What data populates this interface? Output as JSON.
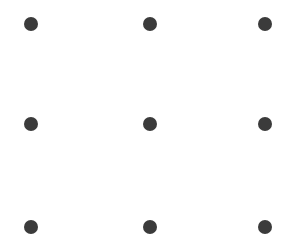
{
  "pattern_lock": {
    "dot_color": "#3b3b3b",
    "background": "#ffffff",
    "dots": [
      {
        "row": 1,
        "col": 1,
        "x": 31,
        "y": 24
      },
      {
        "row": 1,
        "col": 2,
        "x": 150,
        "y": 24
      },
      {
        "row": 1,
        "col": 3,
        "x": 265,
        "y": 24
      },
      {
        "row": 2,
        "col": 1,
        "x": 31,
        "y": 124
      },
      {
        "row": 2,
        "col": 2,
        "x": 150,
        "y": 124
      },
      {
        "row": 2,
        "col": 3,
        "x": 265,
        "y": 124
      },
      {
        "row": 3,
        "col": 1,
        "x": 31,
        "y": 227
      },
      {
        "row": 3,
        "col": 2,
        "x": 150,
        "y": 227
      },
      {
        "row": 3,
        "col": 3,
        "x": 265,
        "y": 227
      }
    ]
  }
}
